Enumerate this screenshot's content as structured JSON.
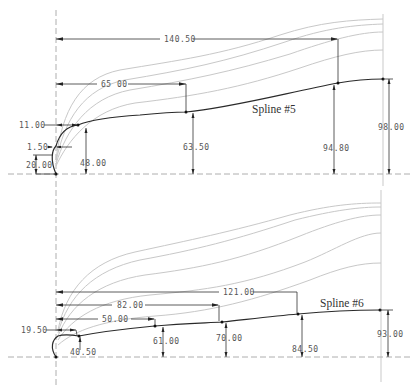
{
  "drawing": {
    "upper": {
      "label": "Spline #5",
      "horizontal_dims": {
        "overall": "140.50",
        "mid": "65 00",
        "first": "11.00",
        "tiny": "1.50"
      },
      "vertical_dims": {
        "start": "20.00",
        "p1": "48.00",
        "p2": "63.50",
        "p3": "94.80",
        "end": "98.00"
      }
    },
    "lower": {
      "label": "Spline #6",
      "horizontal_dims": {
        "overall": "121.00",
        "mid2": "82.00",
        "mid1": "50.00",
        "first": "19.50"
      },
      "vertical_dims": {
        "p1": "40.50",
        "p2": "61.00",
        "p3": "70.00",
        "p4": "84.50",
        "end": "93.00"
      }
    },
    "colors": {
      "spline": "#2a2a2a",
      "ghost_curves": "#c8c8c8",
      "dimension": "#333333",
      "axis": "#999999"
    }
  }
}
